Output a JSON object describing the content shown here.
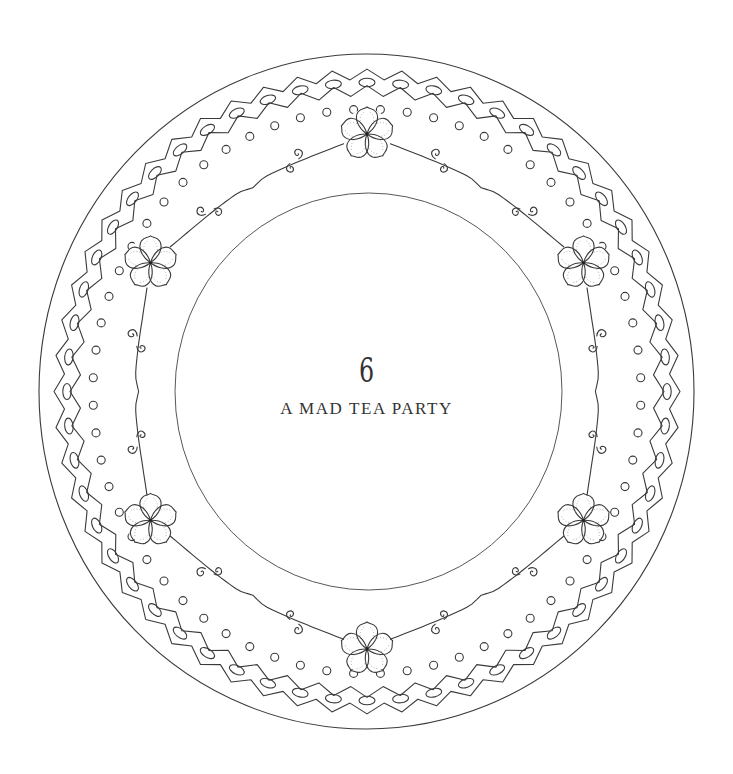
{
  "chapter": {
    "number": "6",
    "title": "A MAD TEA PARTY"
  },
  "illustration": {
    "subject": "decorative plate border",
    "flower_count": 6,
    "line_color": "#3a3a3a",
    "background_color": "#ffffff"
  }
}
